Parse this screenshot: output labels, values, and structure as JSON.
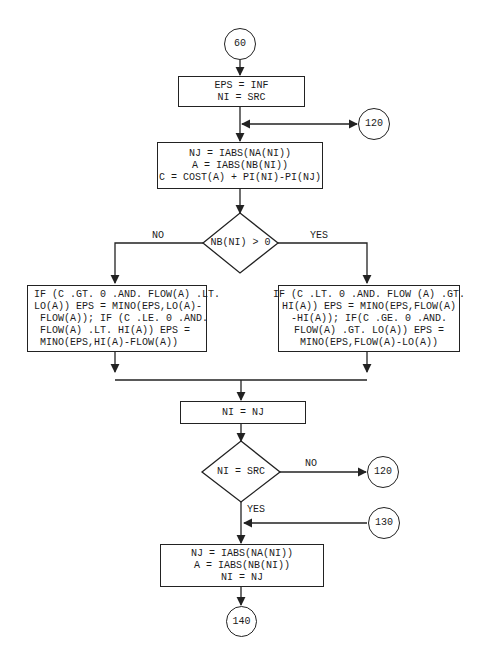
{
  "connectors": {
    "start": "60",
    "loop_top": "120",
    "loop_no": "120",
    "entry_130": "130",
    "end": "140"
  },
  "boxes": {
    "init": [
      "EPS = INF",
      "NI = SRC"
    ],
    "compute": [
      "NJ = IABS(NA(NI))",
      "A = IABS(NB(NI))",
      "C = COST(A) + PI(NI)-PI(NJ)"
    ],
    "no_branch": [
      "IF (C .GT. 0 .AND. FLOW(A) .LT.",
      "LO(A)) EPS = MINO(EPS,LO(A)-",
      " FLOW(A)); IF (C .LE. 0 .AND.",
      " FLOW(A) .LT. HI(A)) EPS =",
      " MINO(EPS,HI(A)-FLOW(A))"
    ],
    "yes_branch": [
      "IF (C .LT. 0 .AND. FLOW (A) .GT.",
      "HI(A)) EPS = MINO(EPS,FLOW(A)",
      "-HI(A)); IF(C .GE. 0 .AND.",
      "FLOW(A) .GT. LO(A)) EPS =",
      "MINO(EPS,FLOW(A)-LO(A))"
    ],
    "advance": [
      "NI = NJ"
    ],
    "final": [
      "NJ = IABS(NA(NI))",
      "A = IABS(NB(NI))",
      "NI = NJ"
    ]
  },
  "decisions": {
    "nb_check": "NB(NI) > 0",
    "src_check": "NI = SRC"
  },
  "labels": {
    "no_left": "NO",
    "yes_right": "YES",
    "no_src": "NO",
    "yes_src": "YES"
  }
}
